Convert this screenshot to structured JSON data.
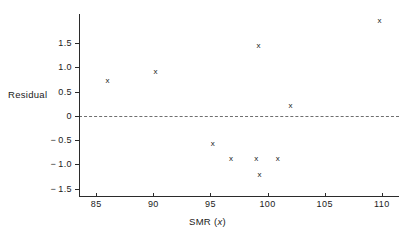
{
  "chart_data": {
    "type": "scatter",
    "title": "",
    "xlabel": "SMR (x)",
    "ylabel": "Residual",
    "xlabel_parts": {
      "prefix": "SMR (",
      "variable": "x",
      "suffix": ")"
    },
    "xlim": [
      83.5,
      111.5
    ],
    "ylim": [
      -1.65,
      2.1
    ],
    "xticks": [
      85,
      90,
      95,
      100,
      105,
      110
    ],
    "xticklabels": [
      "85",
      "90",
      "95",
      "100",
      "105",
      "110"
    ],
    "yticks": [
      1.5,
      1.0,
      0.5,
      0,
      -0.5,
      -1.0,
      -1.5
    ],
    "yticklabels": [
      "1.5",
      "1.0",
      "0.5",
      "0",
      "-0.5",
      "-1.0",
      "-1.5"
    ],
    "grid": false,
    "legend": null,
    "marker": "x",
    "marker_color": "#1a1a1a",
    "reference_line": {
      "y": 0,
      "style": "dashed",
      "color": "#6f6f6f"
    },
    "points": [
      {
        "x": 86.0,
        "y": 0.74
      },
      {
        "x": 90.2,
        "y": 0.91
      },
      {
        "x": 95.2,
        "y": -0.57
      },
      {
        "x": 96.8,
        "y": -0.88
      },
      {
        "x": 99.0,
        "y": -0.88
      },
      {
        "x": 99.2,
        "y": 1.46
      },
      {
        "x": 99.3,
        "y": -1.2
      },
      {
        "x": 100.9,
        "y": -0.88
      },
      {
        "x": 102.0,
        "y": 0.22
      },
      {
        "x": 109.8,
        "y": 1.96
      }
    ]
  }
}
